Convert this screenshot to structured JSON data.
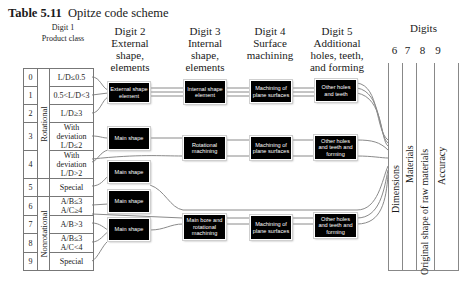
{
  "title": {
    "number": "Table 5.11",
    "text": "Opitze code scheme"
  },
  "headers": [
    {
      "line1": "Digit 1",
      "line2": "Product class"
    },
    {
      "line1": "Digit 2",
      "line2": "External",
      "line3": "shape,",
      "line4": "elements"
    },
    {
      "line1": "Digit 3",
      "line2": "Internal",
      "line3": "shape,",
      "line4": "elements"
    },
    {
      "line1": "Digit 4",
      "line2": "Surface",
      "line3": "machining"
    },
    {
      "line1": "Digit 5",
      "line2": "Additional",
      "line3": "holes, teeth,",
      "line4": "and forming"
    }
  ],
  "digits_header": {
    "title": "Digits",
    "numbers": [
      "6",
      "7",
      "8",
      "9"
    ]
  },
  "supplementary": [
    "Dimensions",
    "Materials",
    "Original shape of raw  materials",
    "Accuracy"
  ],
  "product_class": {
    "groups": [
      "Rotational",
      "Nonrotational"
    ],
    "rows": [
      {
        "num": "0",
        "cond": "L/D≤0.5"
      },
      {
        "num": "1",
        "cond": "0.5<L/D<3"
      },
      {
        "num": "2",
        "cond": "L/D≥3"
      },
      {
        "num": "3",
        "cond": "With deviation L/D≤2"
      },
      {
        "num": "4",
        "cond": "With deviation L/D>2"
      },
      {
        "num": "5",
        "cond": "Special"
      },
      {
        "num": "6",
        "cond": "A/B≤3 A/C≥4"
      },
      {
        "num": "7",
        "cond": "A/B>3"
      },
      {
        "num": "8",
        "cond": "A/B≤3 A/C<4"
      },
      {
        "num": "9",
        "cond": "Special"
      }
    ]
  },
  "boxes": {
    "digit2": [
      "External shape element",
      "Main shape",
      "Main shape",
      "Main shape",
      "Main shape"
    ],
    "digit3": [
      "Internal shape element",
      "Rotational machining",
      "Main bore and rotational machining"
    ],
    "digit4": [
      "Machining of plane surfaces",
      "Machining of plane surfaces",
      "Machining of plane surfaces"
    ],
    "digit5": [
      "Other holes and teeth",
      "Other holes and teeth and forming",
      "Other holes and teeth and forming"
    ]
  }
}
